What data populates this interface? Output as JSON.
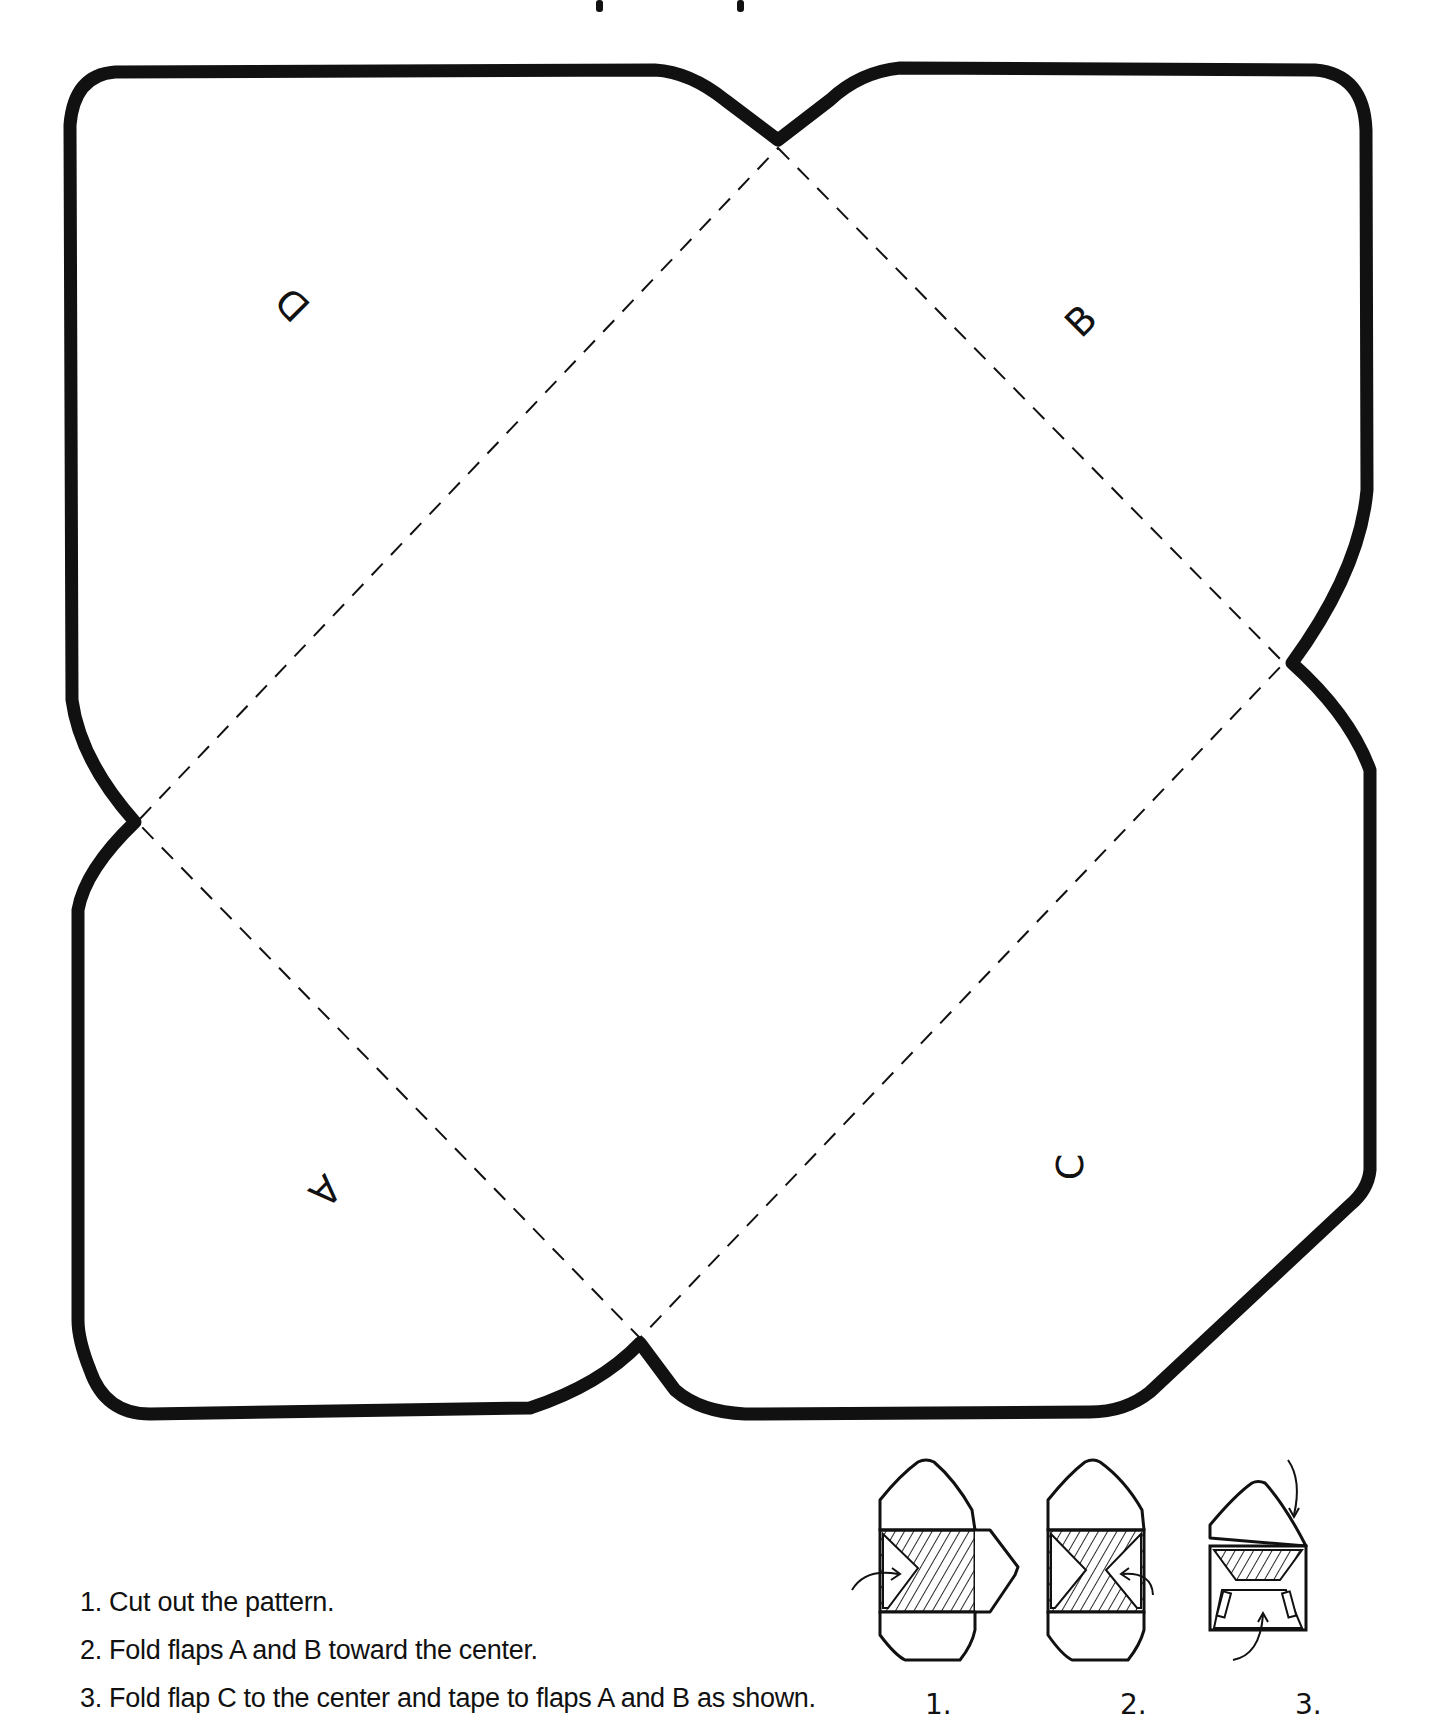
{
  "title_fragment": "",
  "pattern": {
    "flap_labels": {
      "D": "D",
      "B": "B",
      "A": "A",
      "C": "C"
    },
    "outline_color": "#111111",
    "fold_line_style": "dashed"
  },
  "instructions": [
    "1. Cut out the pattern.",
    "2. Fold flaps A and B toward the center.",
    "3. Fold flap C to the center and tape to flaps A and B as shown."
  ],
  "steps": [
    {
      "label": "1."
    },
    {
      "label": "2."
    },
    {
      "label": "3."
    }
  ]
}
